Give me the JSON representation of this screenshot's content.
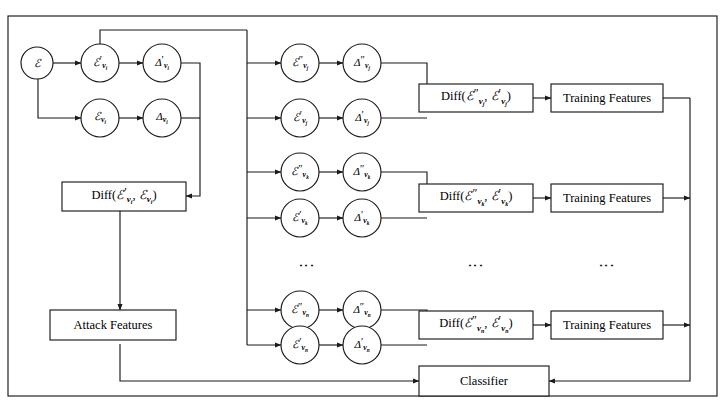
{
  "figure": {
    "type": "flow-diagram",
    "title": "",
    "background_color": "#ffffff",
    "stroke_color": "#1a1a1a"
  },
  "nodes": {
    "source": {
      "label": "E",
      "name": "epsilon-source"
    },
    "row_i_top": {
      "label": "E'v_i",
      "name": "epsilon-prime-vi"
    },
    "row_i_top_delta": {
      "label": "D'v_i",
      "name": "delta-prime-vi"
    },
    "row_i_bot": {
      "label": "Ev_i",
      "name": "epsilon-vi"
    },
    "row_i_bot_delta": {
      "label": "Dv_i",
      "name": "delta-vi"
    },
    "row_j_top": {
      "label": "E''v_j",
      "name": "epsilon-dprime-vj"
    },
    "row_j_top_delta": {
      "label": "D''v_j",
      "name": "delta-dprime-vj"
    },
    "row_j_bot": {
      "label": "E'v_j",
      "name": "epsilon-prime-vj"
    },
    "row_j_bot_delta": {
      "label": "D'v_j",
      "name": "delta-prime-vj"
    },
    "row_k_top": {
      "label": "E''v_k",
      "name": "epsilon-dprime-vk"
    },
    "row_k_top_delta": {
      "label": "D''v_k",
      "name": "delta-dprime-vk"
    },
    "row_k_bot": {
      "label": "E'v_k",
      "name": "epsilon-prime-vk"
    },
    "row_k_bot_delta": {
      "label": "D'v_k",
      "name": "delta-prime-vk"
    },
    "row_n_top": {
      "label": "E''v_n",
      "name": "epsilon-dprime-vn"
    },
    "row_n_top_delta": {
      "label": "D''v_n",
      "name": "delta-dprime-vn"
    },
    "row_n_bot": {
      "label": "E'v_n",
      "name": "epsilon-prime-vn"
    },
    "row_n_bot_delta": {
      "label": "D'v_n",
      "name": "delta-prime-vn"
    }
  },
  "boxes": {
    "diff_i": {
      "label": "Diff(E'v_i, Ev_i)",
      "name": "diff-box-i"
    },
    "diff_j": {
      "label": "Diff(E''v_j, E'v_j)",
      "name": "diff-box-j"
    },
    "diff_k": {
      "label": "Diff(E''v_k, E'v_k)",
      "name": "diff-box-k"
    },
    "diff_n": {
      "label": "Diff(E''v_n, E'v_n)",
      "name": "diff-box-n"
    },
    "training_j": {
      "label": "Training Features",
      "name": "training-features-j"
    },
    "training_k": {
      "label": "Training Features",
      "name": "training-features-k"
    },
    "training_n": {
      "label": "Training Features",
      "name": "training-features-n"
    },
    "attack": {
      "label": "Attack Features",
      "name": "attack-features"
    },
    "classifier": {
      "label": "Classifier",
      "name": "classifier"
    }
  },
  "ellipsis": {
    "nodes_column": "⋮",
    "diff_column": "⋮",
    "training_column": "⋮"
  }
}
